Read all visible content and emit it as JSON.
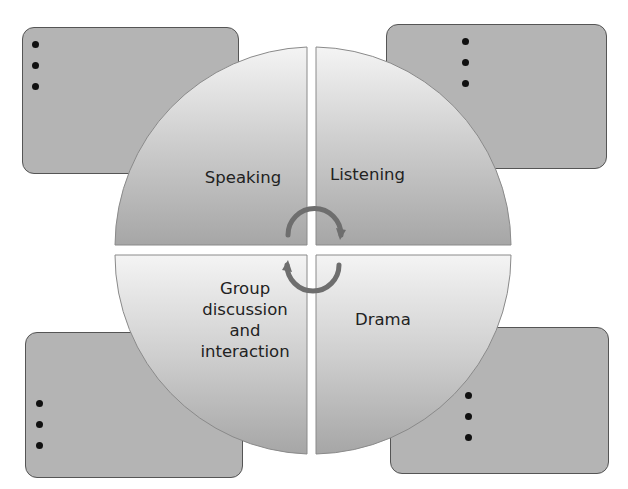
{
  "diagram": {
    "type": "four-quadrant cycle",
    "quadrants": [
      {
        "position": "top-left",
        "label": "Speaking"
      },
      {
        "position": "top-right",
        "label": "Listening"
      },
      {
        "position": "bottom-left",
        "label": "Group discussion and interaction",
        "lines": [
          "Group",
          "discussion",
          "and",
          "interaction"
        ]
      },
      {
        "position": "bottom-right",
        "label": "Drama"
      }
    ],
    "side_boxes": [
      {
        "position": "top-left",
        "bullets": 3
      },
      {
        "position": "top-right",
        "bullets": 3
      },
      {
        "position": "bottom-left",
        "bullets": 3
      },
      {
        "position": "bottom-right",
        "bullets": 3
      }
    ],
    "center_icon": "circular-arrows-icon",
    "colors": {
      "box_fill": "#b4b4b4",
      "box_border": "#555555",
      "sector_light": "#f2f2f2",
      "sector_dark": "#a8a8a8",
      "arrow": "#6e6e6e"
    }
  }
}
